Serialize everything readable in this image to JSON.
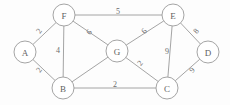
{
  "figure": {
    "name": "weighted-undirected-graph",
    "background_color": "#fdfdfd",
    "stroke_color": "#9a9a9a",
    "text_color": "#5f5f5f",
    "width": 230,
    "height": 105
  },
  "chart_data": {
    "type": "diagram",
    "title": "",
    "xlabel": "",
    "ylabel": "",
    "graph_type": "undirected weighted graph",
    "node_labels": [
      "A",
      "B",
      "C",
      "D",
      "E",
      "F",
      "G"
    ],
    "nodes": [
      {
        "id": "A",
        "label": "A",
        "cx": 25,
        "cy": 52,
        "r": 11
      },
      {
        "id": "B",
        "label": "B",
        "cx": 63,
        "cy": 88,
        "r": 11
      },
      {
        "id": "C",
        "label": "C",
        "cx": 167,
        "cy": 88,
        "r": 11
      },
      {
        "id": "D",
        "label": "D",
        "cx": 208,
        "cy": 52,
        "r": 11
      },
      {
        "id": "E",
        "label": "E",
        "cx": 173,
        "cy": 15,
        "r": 11
      },
      {
        "id": "F",
        "label": "F",
        "cx": 64,
        "cy": 15,
        "r": 11
      },
      {
        "id": "G",
        "label": "G",
        "cx": 117,
        "cy": 51,
        "r": 11
      }
    ],
    "edges": [
      {
        "id": "A-F",
        "source": "A",
        "target": "F",
        "weight": "2",
        "label_x": 39,
        "label_y": 31,
        "label_rotate": -55
      },
      {
        "id": "A-B",
        "source": "A",
        "target": "B",
        "weight": "2",
        "label_x": 39,
        "label_y": 70,
        "label_rotate": -55
      },
      {
        "id": "F-E",
        "source": "F",
        "target": "E",
        "weight": "5",
        "label_x": 118,
        "label_y": 11,
        "label_rotate": 0
      },
      {
        "id": "F-B",
        "source": "F",
        "target": "B",
        "weight": "4",
        "label_x": 58,
        "label_y": 50,
        "label_rotate": 0
      },
      {
        "id": "F-G",
        "source": "F",
        "target": "G",
        "weight": "6",
        "label_x": 89,
        "label_y": 32,
        "label_rotate": -50
      },
      {
        "id": "G-E",
        "source": "G",
        "target": "E",
        "weight": "6",
        "label_x": 144,
        "label_y": 31,
        "label_rotate": -50
      },
      {
        "id": "G-B",
        "source": "G",
        "target": "B",
        "weight": "",
        "label_x": 0,
        "label_y": 0,
        "label_rotate": 0
      },
      {
        "id": "G-C",
        "source": "G",
        "target": "C",
        "weight": "2",
        "label_x": 140,
        "label_y": 63,
        "label_rotate": -50
      },
      {
        "id": "E-C",
        "source": "E",
        "target": "C",
        "weight": "9",
        "label_x": 167,
        "label_y": 51,
        "label_rotate": 0
      },
      {
        "id": "E-D",
        "source": "E",
        "target": "D",
        "weight": "8",
        "label_x": 196,
        "label_y": 31,
        "label_rotate": -50
      },
      {
        "id": "C-D",
        "source": "C",
        "target": "D",
        "weight": "9",
        "label_x": 192,
        "label_y": 70,
        "label_rotate": -50
      },
      {
        "id": "B-C",
        "source": "B",
        "target": "C",
        "weight": "2",
        "label_x": 115,
        "label_y": 84,
        "label_rotate": 0
      }
    ],
    "edge_list_readable": [
      "A-F: 2",
      "A-B: 2",
      "F-E: 5",
      "F-B: 4",
      "F-G: 6",
      "G-E: 6",
      "G-B: (unlabeled)",
      "G-C: 2",
      "E-C: 9",
      "E-D: 8",
      "C-D: 9",
      "B-C: 2"
    ]
  }
}
